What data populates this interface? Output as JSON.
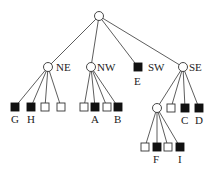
{
  "diagram": {
    "type": "quadtree",
    "root": {
      "id": "root",
      "x": 99,
      "y": 16
    },
    "quadrants": [
      {
        "id": "NE",
        "label": "NE",
        "x": 48,
        "y": 67,
        "kind": "inner",
        "children": [
          {
            "x": 15,
            "y": 107,
            "color": "black",
            "label": "G"
          },
          {
            "x": 31,
            "y": 107,
            "color": "black",
            "label": "H"
          },
          {
            "x": 45,
            "y": 107,
            "color": "white",
            "label": ""
          },
          {
            "x": 61,
            "y": 107,
            "color": "white",
            "label": ""
          }
        ]
      },
      {
        "id": "NW",
        "label": "NW",
        "x": 91,
        "y": 67,
        "kind": "inner",
        "children": [
          {
            "x": 84,
            "y": 107,
            "color": "white",
            "label": ""
          },
          {
            "x": 95,
            "y": 107,
            "color": "black",
            "label": "A"
          },
          {
            "x": 107,
            "y": 107,
            "color": "white",
            "label": ""
          },
          {
            "x": 118,
            "y": 107,
            "color": "black",
            "label": "B"
          }
        ]
      },
      {
        "id": "SW",
        "label": "SW",
        "x": 138,
        "y": 67,
        "kind": "leaf",
        "color": "black",
        "leaf_label": "E"
      },
      {
        "id": "SE",
        "label": "SE",
        "x": 183,
        "y": 67,
        "kind": "inner",
        "children": [
          {
            "x": 157,
            "y": 108,
            "kind": "inner",
            "label": "",
            "children": [
              {
                "x": 145,
                "y": 147,
                "color": "white",
                "label": ""
              },
              {
                "x": 157,
                "y": 147,
                "color": "black",
                "label": "F"
              },
              {
                "x": 168,
                "y": 147,
                "color": "white",
                "label": ""
              },
              {
                "x": 180,
                "y": 147,
                "color": "black",
                "label": "I"
              }
            ]
          },
          {
            "x": 171,
            "y": 108,
            "color": "white",
            "label": ""
          },
          {
            "x": 185,
            "y": 108,
            "color": "black",
            "label": "C"
          },
          {
            "x": 199,
            "y": 108,
            "color": "black",
            "label": "D"
          }
        ]
      }
    ],
    "labels": {
      "NE": "NE",
      "NW": "NW",
      "SW": "SW",
      "SE": "SE",
      "A": "A",
      "B": "B",
      "C": "C",
      "D": "D",
      "E": "E",
      "F": "F",
      "G": "G",
      "H": "H",
      "I": "I"
    },
    "colors": {
      "line": "#333333",
      "black_leaf": "#111111",
      "white_leaf": "#ffffff"
    }
  }
}
